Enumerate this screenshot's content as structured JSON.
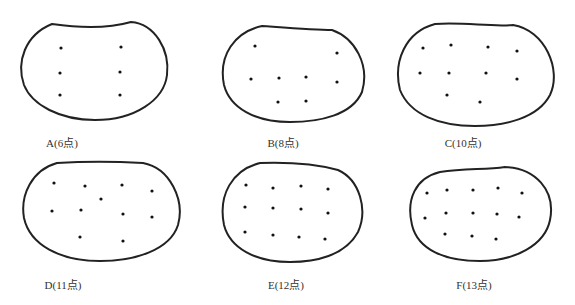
{
  "panels": [
    {
      "id": "A",
      "label": "A(6点)",
      "label_pos": [
        62,
        138
      ],
      "outline": "M52,24 C80,28 110,28 131,22 C155,24 170,50 167,75 C164,100 135,120 95,120 C60,120 32,105 24,85 C16,62 25,35 52,24 Z",
      "dots": [
        [
          61,
          48
        ],
        [
          121,
          47
        ],
        [
          60,
          73
        ],
        [
          120,
          72
        ],
        [
          60,
          95
        ],
        [
          120,
          95
        ]
      ]
    },
    {
      "id": "B",
      "label": "B(8点)",
      "label_pos": [
        283,
        138
      ],
      "outline": "M262,26 C290,28 315,30 332,30 C355,38 370,65 362,92 C352,115 320,122 290,122 C255,122 230,108 224,85 C218,55 235,32 262,26 Z",
      "dots": [
        [
          255,
          46
        ],
        [
          337,
          53
        ],
        [
          251,
          79
        ],
        [
          279,
          78
        ],
        [
          306,
          77
        ],
        [
          337,
          82
        ],
        [
          278,
          102
        ],
        [
          306,
          101
        ]
      ]
    },
    {
      "id": "C",
      "label": "C(10点)",
      "label_pos": [
        463,
        138
      ],
      "outline": "M435,24 C465,22 490,27 513,25 C545,30 562,70 550,95 C538,118 505,126 475,126 C440,126 410,115 400,90 C393,62 405,32 435,24 Z",
      "dots": [
        [
          423,
          48
        ],
        [
          451,
          45
        ],
        [
          488,
          47
        ],
        [
          517,
          51
        ],
        [
          420,
          73
        ],
        [
          449,
          73
        ],
        [
          486,
          73
        ],
        [
          517,
          79
        ],
        [
          447,
          95
        ],
        [
          480,
          102
        ]
      ]
    },
    {
      "id": "D",
      "label": "D(11点)",
      "label_pos": [
        63,
        280
      ],
      "outline": "M57,163 C90,161 125,162 143,163 C170,168 185,200 178,225 C170,250 135,261 100,261 C60,261 30,245 24,218 C20,195 32,170 57,163 Z",
      "dots": [
        [
          54,
          183
        ],
        [
          85,
          186
        ],
        [
          122,
          185
        ],
        [
          152,
          191
        ],
        [
          101,
          199
        ],
        [
          52,
          211
        ],
        [
          81,
          210
        ],
        [
          123,
          214
        ],
        [
          152,
          217
        ],
        [
          80,
          237
        ],
        [
          123,
          241
        ]
      ]
    },
    {
      "id": "E",
      "label": "E(12点)",
      "label_pos": [
        286,
        280
      ],
      "outline": "M260,163 C290,162 320,165 338,170 C360,180 368,210 358,232 C345,256 315,262 290,262 C255,262 230,248 224,225 C218,195 232,170 260,163 Z",
      "dots": [
        [
          246,
          185
        ],
        [
          273,
          188
        ],
        [
          301,
          186
        ],
        [
          328,
          189
        ],
        [
          245,
          207
        ],
        [
          273,
          208
        ],
        [
          301,
          209
        ],
        [
          328,
          213
        ],
        [
          245,
          232
        ],
        [
          273,
          235
        ],
        [
          299,
          237
        ],
        [
          325,
          239
        ]
      ]
    },
    {
      "id": "F",
      "label": "F(13点)",
      "label_pos": [
        474,
        280
      ],
      "outline": "M440,172 C465,168 485,170 505,167 C535,168 556,190 550,220 C545,245 515,261 480,261 C445,261 418,250 412,225 C406,200 415,178 440,172 Z",
      "dots": [
        [
          427,
          193
        ],
        [
          447,
          190
        ],
        [
          473,
          190
        ],
        [
          498,
          188
        ],
        [
          522,
          193
        ],
        [
          425,
          218
        ],
        [
          446
        ],
        [
          473,
          213
        ],
        [
          497,
          214
        ],
        [
          519,
          217
        ],
        [
          445,
          234
        ],
        [
          472,
          236
        ],
        [
          496,
          239
        ]
      ]
    }
  ],
  "style": {
    "stroke": "#222222",
    "dot": "#111111"
  }
}
